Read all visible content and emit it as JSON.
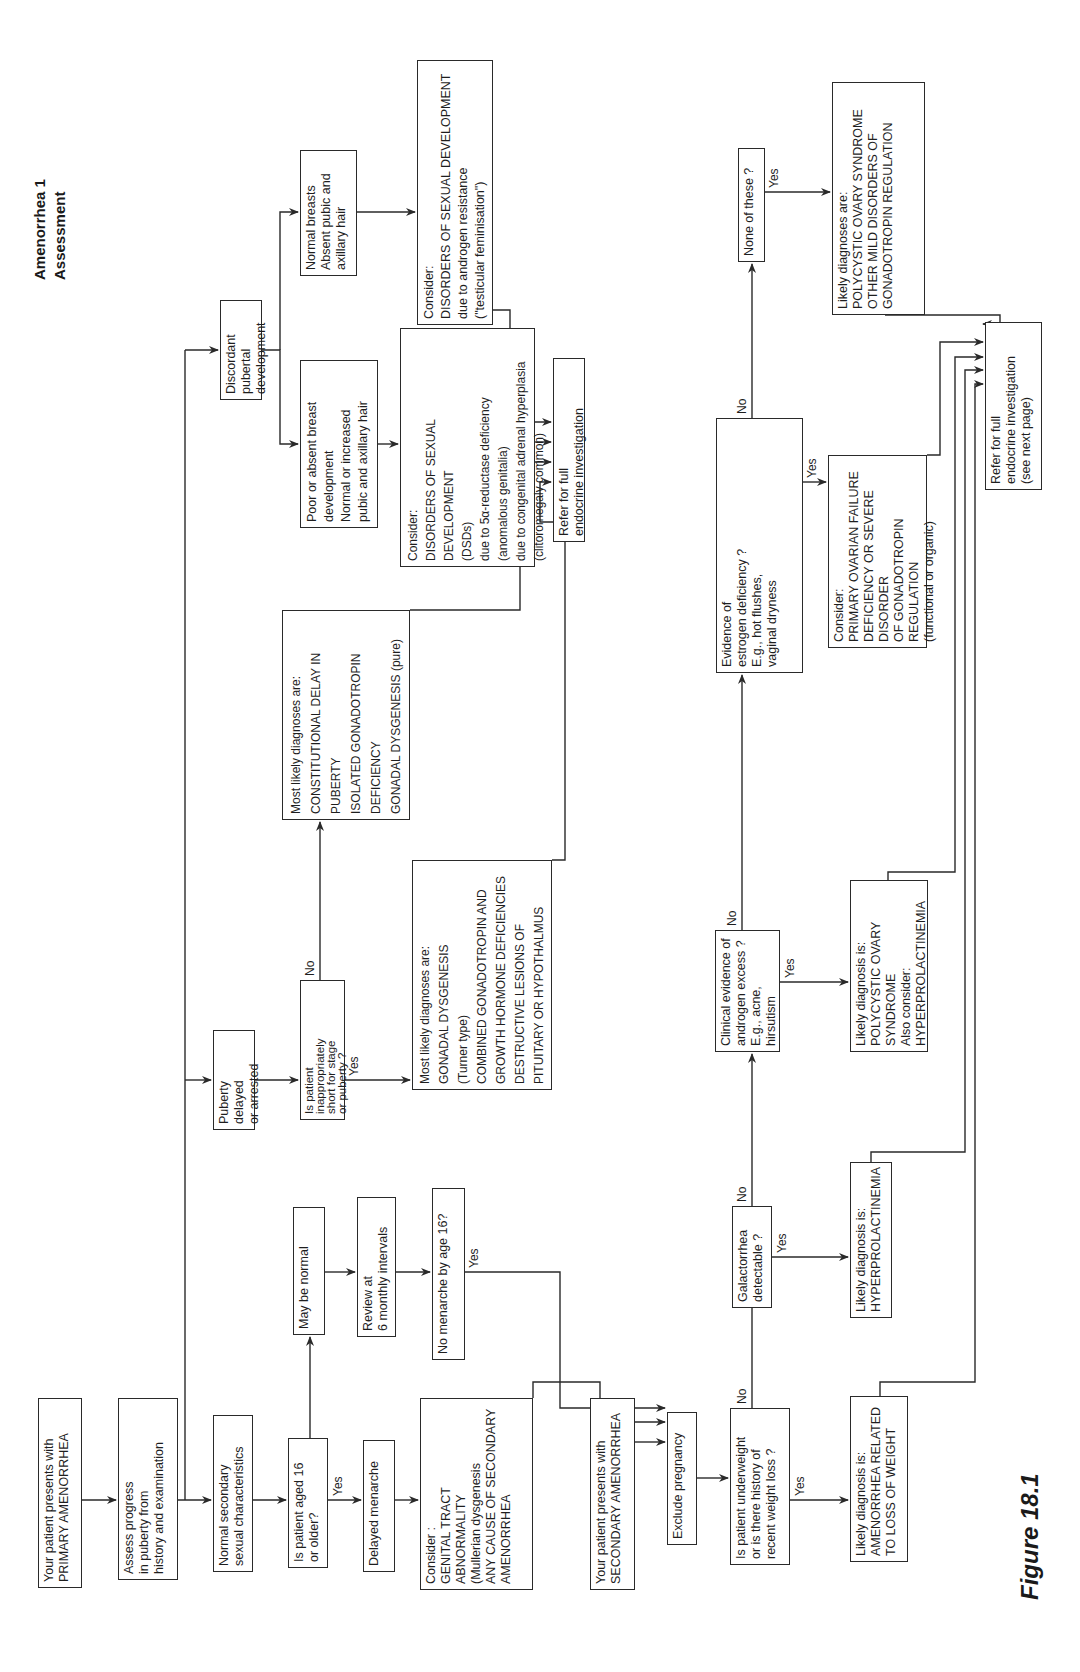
{
  "header": {
    "title": "Amenorrhea 1",
    "subtitle": "Assessment"
  },
  "figure_label": "Figure 18.1",
  "nodes": {
    "primary": "Your patient presents with\nPRIMARY AMENORRHEA",
    "assess": "Assess progress\nin puberty from\nhistory and examination",
    "normal_secondary": "Normal secondary\nsexual characteristics",
    "aged16": "Is patient aged 16\nor older?",
    "delayed_menarche": "Delayed menarche",
    "genital_tract": "Consider :\nGENITAL TRACT\nABNORMALITY\n(Mullerian dysgenesis\nANY CAUSE OF SECONDARY\nAMENORRHEA",
    "may_be_normal": "May be normal",
    "review": "Review at\n6 monthly intervals",
    "no_menarche": "No menarche by age 16?",
    "secondary": "Your patient presents with\nSECONDARY AMENORRHEA",
    "exclude_pregnancy": "Exclude pregnancy",
    "underweight": "Is patient underweight\nor is there history of\nrecent weight loss ?",
    "weight_loss_dx": "Likely diagnosis is:\nAMENORRHEA RELATED\nTO LOSS OF WEIGHT",
    "galactorrhea": "Galactorrhea\ndetectable ?",
    "hyperprolactinemia_dx": "Likely diagnosis is:\nHYPERPROLACTINEMIA",
    "androgen_excess": "Clinical evidence of\nandrogen excess ?\nE.g., acne, hirsutism",
    "pcos_dx": "Likely diagnosis is:\nPOLYCYSTIC OVARY SYNDROME\nAlso consider:\nHYPERPROLACTINEMIA",
    "estrogen_deficiency": "Evidence of\nestrogen deficiency ?\nE.g., hot flushes,\nvaginal dryness",
    "ovarian_failure": "Consider:\nPRIMARY OVARIAN FAILURE\nDEFICIENCY OR SEVERE DISORDER\nOF GONADOTROPIN REGULATION\n(functional or organic)",
    "none_of_these": "None of these ?",
    "pcos_mild_dx": "Likely diagnoses are:\nPOLYCYSTIC OVARY SYNDROME\nOTHER MILD DISORDERS OF\nGONADOTROPIN REGULATION",
    "refer_secondary": "Refer for full\nendocrine investigation\n(see next page)",
    "puberty_delayed": "Puberty delayed\nor arrested",
    "short_stature": "Is patient\ninappropriately\nshort for stage\nor puberty ?",
    "short_yes_dx": "Most likely diagnoses are:\nGONADAL DYSGENESIS\n(Turner type)\nCOMBINED GONADOTROPIN AND\nGROWTH HORMONE DEFICIENCIES\nDESTRUCTIVE LESIONS OF\nPITUITARY OR HYPOTHALMUS",
    "short_no_dx": "Most likely diagnoses are:\nCONSTITUTIONAL DELAY IN\nPUBERTY\nISOLATED GONADOTROPIN\nDEFICIENCY\nGONADAL DYSGENESIS (pure)",
    "discordant": "Discordant pubertal\ndevelopment",
    "poor_breast": "Poor or absent breast\ndevelopment\nNormal or increased\npubic and axillary hair",
    "normal_breasts": "Normal breasts\nAbsent pubic and\naxillary hair",
    "dsd_5alpha": "Consider:\nDISORDERS OF SEXUAL DEVELOPMENT\n(DSDs)\ndue to 5α-reductase deficiency\n(anomalous genitalia)\ndue to congenital adrenal hyperplasia\n(clitoromegaly common)",
    "dsd_androgen": "Consider:\nDISORDERS OF SEXUAL DEVELOPMENT\ndue to androgen resistance\n(\"testicular feminisation\")",
    "refer_primary": "Refer for full\nendocrine investigation"
  },
  "edge_labels": {
    "aged16_yes": "Yes",
    "no_menarche_yes": "Yes",
    "underweight_no": "No",
    "underweight_yes": "Yes",
    "galactorrhea_no": "No",
    "galactorrhea_yes": "Yes",
    "androgen_no": "No",
    "androgen_yes": "Yes",
    "estrogen_no": "No",
    "estrogen_yes": "Yes",
    "none_yes": "Yes",
    "short_no": "No",
    "short_yes": "Yes"
  }
}
